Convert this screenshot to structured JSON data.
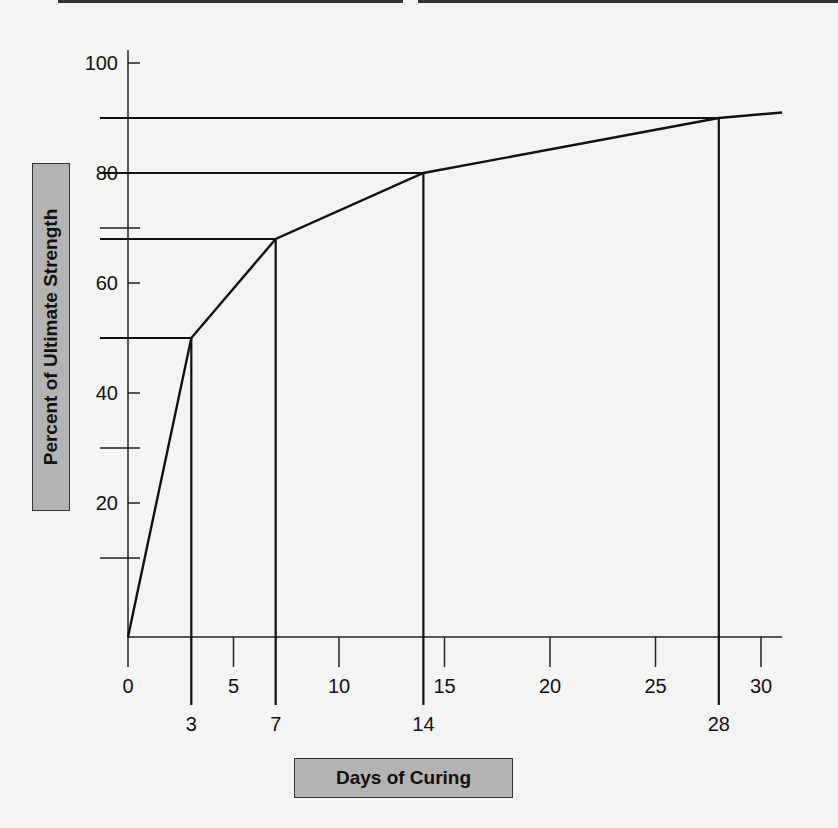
{
  "chart_data": {
    "type": "line",
    "title": "",
    "xlabel": "Days of Curing",
    "ylabel": "Percent of Ultimate Strength",
    "x": [
      0,
      3,
      7,
      14,
      28,
      31
    ],
    "series": [
      {
        "name": "Concrete strength gain",
        "values": [
          0,
          50,
          68,
          80,
          90,
          91
        ]
      }
    ],
    "reference_points": [
      {
        "day": 3,
        "percent": 50
      },
      {
        "day": 7,
        "percent": 68
      },
      {
        "day": 14,
        "percent": 80
      },
      {
        "day": 28,
        "percent": 90
      }
    ],
    "x_ticks_major": [
      "0",
      "5",
      "10",
      "15",
      "20",
      "25",
      "30"
    ],
    "x_ticks_marked": [
      "3",
      "7",
      "14",
      "28"
    ],
    "y_ticks": [
      "20",
      "40",
      "60",
      "80",
      "100"
    ],
    "xlim": [
      0,
      32
    ],
    "ylim": [
      0,
      100
    ],
    "grid": false,
    "legend": "none"
  },
  "labels": {
    "ylabel": "Percent of Ultimate Strength",
    "xlabel": "Days of Curing"
  },
  "colors": {
    "line": "#111111",
    "label_box": "#b3b3b3",
    "background": "#f4f4f2"
  }
}
